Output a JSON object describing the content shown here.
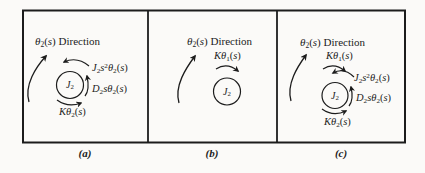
{
  "figure": {
    "background": "#fbfaf8",
    "ink": "#1c1c1c"
  },
  "math": {
    "direction": [
      [
        "i",
        "θ"
      ],
      [
        "sub",
        "2"
      ],
      [
        "r",
        "("
      ],
      [
        "i",
        "s"
      ],
      [
        "r",
        ")"
      ],
      [
        "r",
        " Direction"
      ]
    ],
    "inertia_torque": [
      [
        "i",
        "J"
      ],
      [
        "sub",
        "2"
      ],
      [
        "i",
        "s"
      ],
      [
        "sup",
        "2"
      ],
      [
        "i",
        "θ"
      ],
      [
        "sub",
        "2"
      ],
      [
        "r",
        "("
      ],
      [
        "i",
        "s"
      ],
      [
        "r",
        ")"
      ]
    ],
    "damper_torque": [
      [
        "i",
        "D"
      ],
      [
        "sub",
        "2"
      ],
      [
        "i",
        "s"
      ],
      [
        "i",
        "θ"
      ],
      [
        "sub",
        "2"
      ],
      [
        "r",
        "("
      ],
      [
        "i",
        "s"
      ],
      [
        "r",
        ")"
      ]
    ],
    "spring_torque_theta2": [
      [
        "i",
        "K"
      ],
      [
        "i",
        "θ"
      ],
      [
        "sub",
        "2"
      ],
      [
        "r",
        "("
      ],
      [
        "i",
        "s"
      ],
      [
        "r",
        ")"
      ]
    ],
    "spring_torque_theta1": [
      [
        "i",
        "K"
      ],
      [
        "i",
        "θ"
      ],
      [
        "sub",
        "1"
      ],
      [
        "r",
        "("
      ],
      [
        "i",
        "s"
      ],
      [
        "r",
        ")"
      ]
    ],
    "inertia": [
      [
        "i",
        "J"
      ],
      [
        "sub",
        "2"
      ]
    ]
  },
  "captions": {
    "a": "(a)",
    "b": "(b)",
    "c": "(c)"
  }
}
